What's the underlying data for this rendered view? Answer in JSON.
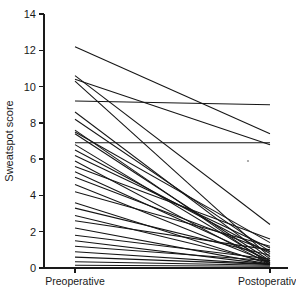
{
  "chart_data": {
    "type": "line",
    "title": "",
    "subtitle": "",
    "xlabel": "",
    "ylabel": "Sweatspot score",
    "categories": [
      "Preoperative",
      "Postoperative"
    ],
    "x": [
      0,
      1
    ],
    "ylim": [
      0,
      14
    ],
    "xlim": [
      -0.25,
      1.25
    ],
    "y_ticks": [
      0,
      2,
      4,
      6,
      8,
      10,
      12,
      14
    ],
    "y_tick_labels": [
      "0",
      "2",
      "4",
      "6",
      "8",
      "10",
      "12",
      "14"
    ],
    "grid": false,
    "legend": false,
    "legend_position": "none",
    "line_color": "#151515",
    "series": [
      {
        "name": "patient-1",
        "values": [
          12.2,
          7.4
        ]
      },
      {
        "name": "patient-2",
        "values": [
          10.6,
          2.4
        ]
      },
      {
        "name": "patient-3",
        "values": [
          10.4,
          6.8
        ]
      },
      {
        "name": "patient-4",
        "values": [
          10.3,
          0.6
        ]
      },
      {
        "name": "patient-5",
        "values": [
          9.2,
          9.0
        ]
      },
      {
        "name": "patient-6",
        "values": [
          8.6,
          0.5
        ]
      },
      {
        "name": "patient-7",
        "values": [
          8.2,
          0.9
        ]
      },
      {
        "name": "patient-8",
        "values": [
          7.6,
          0.2
        ]
      },
      {
        "name": "patient-9",
        "values": [
          7.5,
          1.4
        ]
      },
      {
        "name": "patient-10",
        "values": [
          7.4,
          0.4
        ]
      },
      {
        "name": "patient-11",
        "values": [
          6.9,
          6.9
        ]
      },
      {
        "name": "patient-12",
        "values": [
          6.8,
          0.3
        ]
      },
      {
        "name": "patient-13",
        "values": [
          6.5,
          0.8
        ]
      },
      {
        "name": "patient-14",
        "values": [
          6.2,
          1.1
        ]
      },
      {
        "name": "patient-15",
        "values": [
          5.9,
          0.2
        ]
      },
      {
        "name": "patient-16",
        "values": [
          5.6,
          1.6
        ]
      },
      {
        "name": "patient-17",
        "values": [
          5.3,
          0.4
        ]
      },
      {
        "name": "patient-18",
        "values": [
          5.0,
          0.9
        ]
      },
      {
        "name": "patient-19",
        "values": [
          4.6,
          0.3
        ]
      },
      {
        "name": "patient-20",
        "values": [
          4.2,
          1.2
        ]
      },
      {
        "name": "patient-21",
        "values": [
          3.6,
          0.2
        ]
      },
      {
        "name": "patient-22",
        "values": [
          3.3,
          0.7
        ]
      },
      {
        "name": "patient-23",
        "values": [
          2.9,
          0.3
        ]
      },
      {
        "name": "patient-24",
        "values": [
          2.6,
          1.0
        ]
      },
      {
        "name": "patient-25",
        "values": [
          2.2,
          0.2
        ]
      },
      {
        "name": "patient-26",
        "values": [
          1.8,
          0.5
        ]
      },
      {
        "name": "patient-27",
        "values": [
          1.5,
          0.2
        ]
      },
      {
        "name": "patient-28",
        "values": [
          1.2,
          0.4
        ]
      },
      {
        "name": "patient-29",
        "values": [
          0.9,
          0.2
        ]
      },
      {
        "name": "patient-30",
        "values": [
          0.6,
          0.2
        ]
      },
      {
        "name": "patient-31",
        "values": [
          0.35,
          0.15
        ]
      },
      {
        "name": "patient-32",
        "values": [
          0.15,
          0.1
        ]
      }
    ]
  }
}
